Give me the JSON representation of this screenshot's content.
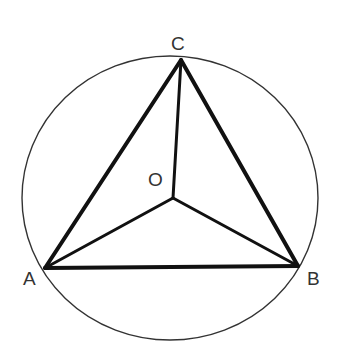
{
  "diagram": {
    "title": "",
    "circle": {
      "cx": 170,
      "cy": 198,
      "rx": 148,
      "ry": 142,
      "color": "#333333"
    },
    "points": {
      "A": {
        "label": "A",
        "x": 45,
        "y": 268
      },
      "B": {
        "label": "B",
        "x": 298,
        "y": 266
      },
      "C": {
        "label": "C",
        "x": 181,
        "y": 60
      },
      "O": {
        "label": "O",
        "x": 173,
        "y": 198
      }
    },
    "labels": {
      "A": "A",
      "B": "B",
      "C": "C",
      "O": "O"
    },
    "segments": [
      "AB",
      "BC",
      "CA",
      "OA",
      "OB",
      "OC"
    ],
    "line_color": "#111111"
  }
}
